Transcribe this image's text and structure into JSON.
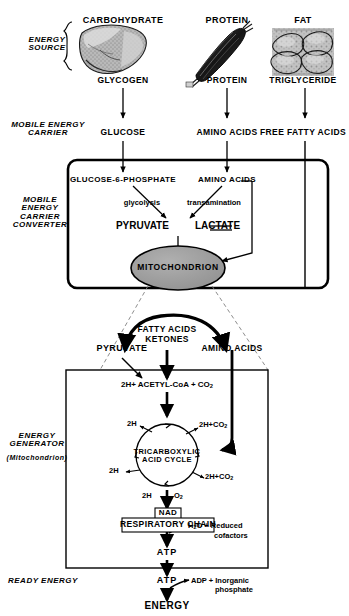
{
  "diagram": {
    "colors": {
      "ink": "#000000",
      "background": "#ffffff",
      "mitochondrion_fill": "#9a9a9a",
      "dashed_guide": "#808080"
    },
    "tiers": [
      {
        "id": "energy-source",
        "label": "ENERGY\nSOURCE",
        "line1": "ENERGY",
        "line2": "SOURCE",
        "line3": "",
        "line4": ""
      },
      {
        "id": "mobile-carrier",
        "label": "MOBILE ENERGY CARRIER",
        "line1": "MOBILE  ENERGY",
        "line2": "CARRIER",
        "line3": "",
        "line4": ""
      },
      {
        "id": "carrier-converter",
        "label": "MOBILE ENERGY CARRIER CONVERTER",
        "line1": "MOBILE",
        "line2": "ENERGY",
        "line3": "CARRIER",
        "line4": "CONVERTER"
      },
      {
        "id": "energy-generator",
        "label": "ENERGY GENERATOR (Mitochondrion)",
        "line1": "ENERGY",
        "line2": "GENERATOR",
        "line3": "(Mitochondrion)",
        "line4": ""
      },
      {
        "id": "ready-energy",
        "label": "READY ENERGY",
        "line1": "READY ENERGY",
        "line2": "",
        "line3": "",
        "line4": ""
      }
    ],
    "sources": [
      {
        "id": "carbohydrate",
        "title": "CARBOHYDRATE",
        "store": "GLYCOGEN",
        "carrier": "GLUCOSE",
        "organ": "liver-illustration"
      },
      {
        "id": "protein",
        "title": "PROTEIN",
        "store": "PROTEIN",
        "carrier": "AMINO ACIDS",
        "organ": "muscle-illustration"
      },
      {
        "id": "fat",
        "title": "FAT",
        "store": "TRIGLYCERIDE",
        "carrier": "FREE FATTY ACIDS",
        "organ": "adipose-illustration"
      }
    ],
    "converter": {
      "inputs": [
        {
          "id": "g6p",
          "label": "GLUCOSE-6-PHOSPHATE"
        },
        {
          "id": "amino-acids",
          "label": "AMINO ACIDS"
        }
      ],
      "processes": [
        {
          "id": "glycolysis",
          "label": "glycolysis"
        },
        {
          "id": "transamination",
          "label": "transamination"
        }
      ],
      "pyruvate": "PYRUVATE",
      "equilibrium": "═",
      "lactate": "LACTATE",
      "organelle": "MITOCHONDRION"
    },
    "generator": {
      "inputs": [
        {
          "id": "pyruvate",
          "label": "PYRUVATE"
        },
        {
          "id": "fatty-acids",
          "label": "FATTY ACIDS"
        },
        {
          "id": "ketones",
          "label": "KETONES"
        },
        {
          "id": "amino-acids",
          "label": "AMINO  ACIDS"
        }
      ],
      "acetyl_line": {
        "h": "2H+",
        "compound": "ACETYL-CoA",
        "plus": "+",
        "co2": "CO",
        "co2_sub": "2"
      },
      "cycle": {
        "line1": "TRICARBOXYLIC",
        "line2": "ACID CYCLE"
      },
      "cycle_outputs": [
        {
          "id": "two-h-upper-left",
          "label": "2H"
        },
        {
          "id": "two-h-lower-left",
          "label": "2H"
        },
        {
          "id": "co2-upper-right",
          "label": "2H+CO",
          "sub": "2"
        },
        {
          "id": "co2-lower-right",
          "label": "2H+CO",
          "sub": "2"
        }
      ],
      "to_chain": {
        "h": "2H",
        "o2": "O",
        "o2_sub": "2"
      },
      "nad": "NAD",
      "respiratory_chain": "RESPIRATORY CHAIN",
      "chain_output": {
        "water": "H",
        "water_sub": "2",
        "water_tail": "O  +",
        "cof1": "Reduced",
        "cof2": "cofactors"
      },
      "atp_inner": "ATP"
    },
    "ready": {
      "atp": "ATP",
      "byproduct1": "ADP  +  Inorganic",
      "byproduct2": "phosphate",
      "energy": "ENERGY"
    }
  }
}
